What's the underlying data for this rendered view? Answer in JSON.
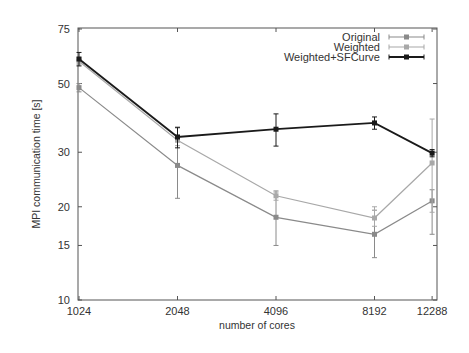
{
  "chart_data": {
    "type": "line",
    "title": "",
    "xlabel": "number of cores",
    "ylabel": "MPI communication time [s]",
    "x_scale": "log2",
    "y_scale": "log10",
    "x": [
      1024,
      2048,
      4096,
      8192,
      12288
    ],
    "x_tick_labels": [
      "1024",
      "2048",
      "4096",
      "8192",
      "12288"
    ],
    "y_ticks": [
      10,
      15,
      20,
      30,
      50,
      75
    ],
    "y_tick_labels": [
      "10",
      "15",
      "20",
      "30",
      "50",
      "75"
    ],
    "xlim": [
      1024,
      13000
    ],
    "ylim": [
      10,
      75
    ],
    "grid": false,
    "legend_position": "top-right",
    "series": [
      {
        "name": "Original",
        "color": "#8a8a8a",
        "values": [
          48.5,
          27.2,
          18.5,
          16.3,
          20.9
        ],
        "err_low": [
          47,
          21.3,
          15.0,
          13.7,
          16.3
        ],
        "err_high": [
          50,
          36.2,
          22.5,
          19.5,
          22.7
        ]
      },
      {
        "name": "Weighted",
        "color": "#a8a8a8",
        "values": [
          59,
          32.8,
          21.7,
          18.4,
          27.7
        ],
        "err_low": [
          57.5,
          31.5,
          21.0,
          17.3,
          19.2
        ],
        "err_high": [
          60.5,
          34.0,
          22.3,
          20.0,
          38.4
        ]
      },
      {
        "name": "Weighted+SFCurve",
        "color": "#1a1a1a",
        "values": [
          60,
          33.6,
          35.6,
          37.3,
          29.8
        ],
        "err_low": [
          57,
          31.0,
          31.4,
          35.6,
          29.0
        ],
        "err_high": [
          63,
          36.0,
          39.9,
          39.0,
          30.6
        ]
      }
    ]
  }
}
